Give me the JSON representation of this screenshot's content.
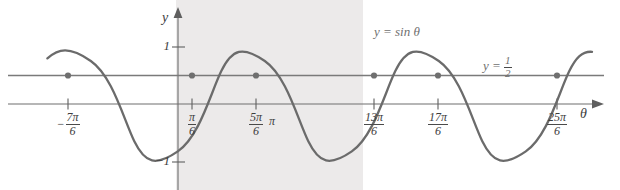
{
  "figure": {
    "kind": "trigonometric-graph",
    "background": "#ffffff",
    "shade_color": "#eceaea",
    "curve_color": "#6b6b6b",
    "line_color": "#7a7a7a",
    "axis_color": "#6e6e6e",
    "text_color": "#3d3d3d",
    "label_color": "#6f6f6f"
  },
  "axes": {
    "y_axis_label": "y",
    "x_axis_label": "θ",
    "y_ticks": [
      {
        "value": 1,
        "label": "1"
      },
      {
        "value": -1,
        "label": "−1"
      }
    ]
  },
  "curve_labels": {
    "sine": "y = sin θ",
    "half": {
      "prefix": "y =",
      "numerator": "1",
      "denominator": "2"
    }
  },
  "x_ticks": [
    {
      "id": "neg-7pi-6",
      "negative": true,
      "numerator": "7π",
      "denominator": "6",
      "simple": null,
      "x": 68
    },
    {
      "id": "pi-6",
      "negative": false,
      "numerator": "π",
      "denominator": "6",
      "simple": null,
      "x": 192
    },
    {
      "id": "5pi-6",
      "negative": false,
      "numerator": "5π",
      "denominator": "6",
      "simple": null,
      "x": 256
    },
    {
      "id": "pi",
      "negative": false,
      "numerator": null,
      "denominator": null,
      "simple": "π",
      "x": 272
    },
    {
      "id": "13pi-6",
      "negative": false,
      "numerator": "13π",
      "denominator": "6",
      "simple": null,
      "x": 374
    },
    {
      "id": "17pi-6",
      "negative": false,
      "numerator": "17π",
      "denominator": "6",
      "simple": null,
      "x": 438
    },
    {
      "id": "25pi-6",
      "negative": false,
      "numerator": "25π",
      "denominator": "6",
      "simple": null,
      "x": 557
    }
  ],
  "chart_data": {
    "type": "line",
    "title": "",
    "xlabel": "θ",
    "ylabel": "y",
    "grid": false,
    "legend_position": "inline-annotations",
    "xlim_radians": [
      -4.15,
      14.95
    ],
    "ylim": [
      -1.35,
      1.5
    ],
    "series": [
      {
        "name": "y = sin θ",
        "kind": "sine",
        "amplitude": 1,
        "period_radians": 6.283185307179586,
        "phase": 0,
        "annotation": "y = sin θ"
      },
      {
        "name": "y = 1/2",
        "kind": "horizontal-line",
        "value": 0.5,
        "annotation": "y = 1/2"
      }
    ],
    "intersections_radians": [
      -3.6651914291880923,
      0.5235987755982988,
      2.6179938779914944,
      6.8067840827778845,
      8.90117918517108,
      13.08996938995747
    ],
    "intersection_labels": [
      "−7π/6",
      "π/6",
      "5π/6",
      "13π/6",
      "17π/6",
      "25π/6"
    ],
    "shaded_interval_radians": [
      0,
      6.283185307179586
    ],
    "x_tick_labels": [
      "−7π/6",
      "π/6",
      "5π/6",
      "π",
      "13π/6",
      "17π/6",
      "25π/6"
    ],
    "y_tick_labels": [
      "1",
      "−1"
    ],
    "y_tick_values": [
      1,
      -1
    ]
  }
}
